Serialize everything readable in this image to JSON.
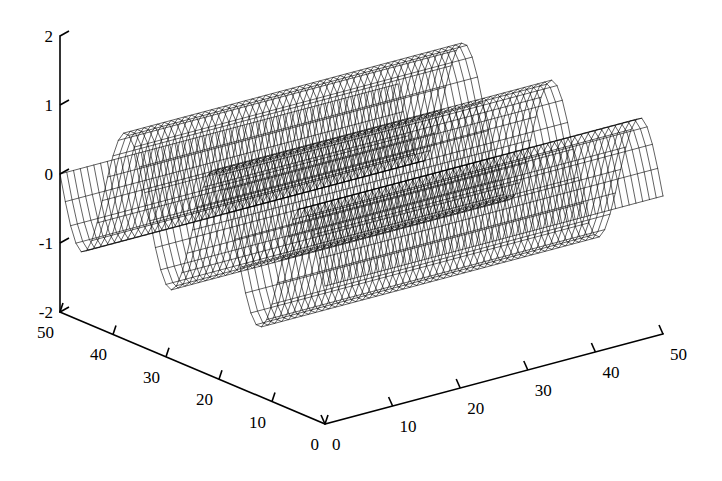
{
  "figure": {
    "kind": "matlab-3d-mesh-plot",
    "background_color": "#ffffff",
    "line_color": "#000000",
    "width": 722,
    "height": 481
  },
  "chart_data": {
    "type": "line",
    "render_style": "3d-wireframe-mesh-surface",
    "title": "",
    "subtitle": "",
    "xlabel": "",
    "ylabel": "",
    "zlabel": "",
    "grid": false,
    "legend": null,
    "legend_position": "none",
    "annotations": [],
    "projection": {
      "type": "orthographic-axonometric",
      "origin_px": [
        325,
        424
      ],
      "x_axis_end_px": [
        60,
        312
      ],
      "y_axis_end_px": [
        663,
        334
      ],
      "z_axis_top_px": [
        60,
        36
      ],
      "z_axis_bottom_px": [
        60,
        312
      ]
    },
    "axes": {
      "x": {
        "label": "",
        "ticks": [
          0,
          10,
          20,
          30,
          40,
          50
        ],
        "ticklabels": [
          "0",
          "10",
          "20",
          "30",
          "40",
          "50"
        ],
        "lim": [
          0,
          50
        ],
        "direction": "down-left",
        "position": "bottom-left-edge"
      },
      "y": {
        "label": "",
        "ticks": [
          0,
          10,
          20,
          30,
          40,
          50
        ],
        "ticklabels": [
          "0",
          "10",
          "20",
          "30",
          "40",
          "50"
        ],
        "lim": [
          0,
          50
        ],
        "direction": "up-right",
        "position": "bottom-right-edge"
      },
      "z": {
        "label": "",
        "ticks": [
          -2,
          -1,
          0,
          1,
          2
        ],
        "ticklabels": [
          "-2",
          "-1",
          "0",
          "1",
          "2"
        ],
        "lim": [
          -2,
          2
        ],
        "direction": "up",
        "position": "left-vertical"
      }
    },
    "surface": {
      "function": "sin(2*pi*3*x/50)",
      "description": "Sinusoidal wave surface, three full periods along the x direction, constant along y",
      "grid_nx": 50,
      "grid_ny": 50,
      "amplitude": 1.0,
      "periods_visible": 3,
      "z_min": -1.0,
      "z_max": 1.0,
      "peak_count": 3,
      "trough_count": 3
    }
  }
}
